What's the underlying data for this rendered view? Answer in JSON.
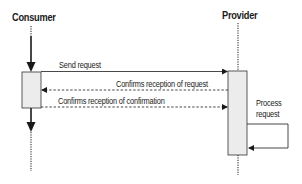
{
  "diagram": {
    "type": "sequence",
    "participants": [
      {
        "id": "consumer",
        "label": "Consumer"
      },
      {
        "id": "provider",
        "label": "Provider"
      }
    ],
    "messages": [
      {
        "from": "consumer",
        "to": "provider",
        "label": "Send request",
        "style": "solid"
      },
      {
        "from": "provider",
        "to": "consumer",
        "label": "Confirms reception of request",
        "style": "dashed"
      },
      {
        "from": "consumer",
        "to": "provider",
        "label": "Confirms reception of confirmation",
        "style": "dashed"
      },
      {
        "from": "provider",
        "to": "provider",
        "label": "Process request",
        "style": "solid"
      }
    ],
    "self_note_lines": [
      "Process",
      "request"
    ],
    "colors": {
      "line": "#1a1a1a",
      "activation_fill": "#ececec",
      "activation_stroke": "#333333"
    }
  }
}
